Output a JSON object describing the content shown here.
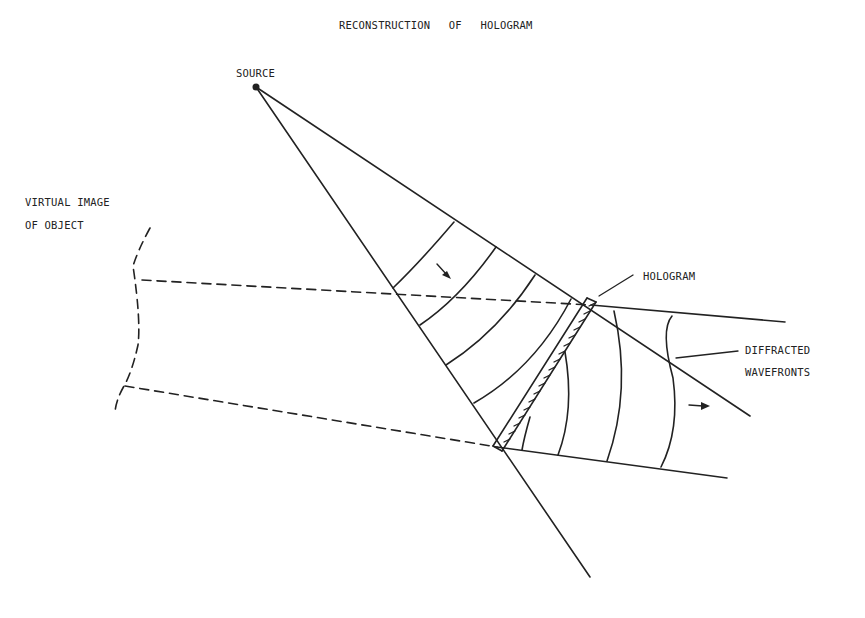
{
  "diagram": {
    "title": "RECONSTRUCTION OF HOLOGRAM",
    "labels": {
      "source": "SOURCE",
      "virtual_image_line1": "VIRTUAL IMAGE",
      "virtual_image_line2": "OF OBJECT",
      "hologram": "HOLOGRAM",
      "diffracted_line1": "DIFFRACTED",
      "diffracted_line2": "WAVEFRONTS"
    },
    "colors": {
      "ink": "#222222",
      "background": "#ffffff"
    },
    "elements": [
      "point source",
      "diverging cone of incident spherical wavefronts (5 arcs)",
      "tilted hologram plate (hatched)",
      "diffracted beam with 4 curved wavefronts",
      "dashed back-projected rays to virtual image",
      "dashed virtual image of object",
      "propagation arrows (2)"
    ]
  }
}
